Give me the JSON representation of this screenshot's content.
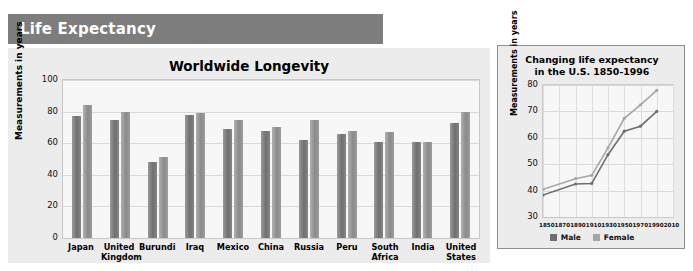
{
  "header": {
    "title": "Life Expectancy"
  },
  "colors": {
    "banner": "#7d7d7d",
    "panel": "#ececec",
    "plot": "#f7f7f7",
    "male": "#6f6f6f",
    "female": "#a6a6a6"
  },
  "main": {
    "title": "Worldwide Longevity",
    "ylabel": "Measurements in years",
    "legend": [
      {
        "label": "Male",
        "swatch": "male"
      },
      {
        "label": "Female",
        "swatch": "female"
      }
    ]
  },
  "inset": {
    "title_line1": "Changing life expectancy",
    "title_line2": "in the U.S. 1850-1996",
    "ylabel": "Measurements in years",
    "legend": [
      {
        "label": "Male",
        "swatch": "male"
      },
      {
        "label": "Female",
        "swatch": "female"
      }
    ]
  },
  "chart_data": [
    {
      "type": "bar",
      "title": "Worldwide Longevity",
      "xlabel": "",
      "ylabel": "Measurements in years",
      "ylim": [
        0,
        100
      ],
      "yticks": [
        0,
        20,
        40,
        60,
        80,
        100
      ],
      "grid": true,
      "legend_position": "bottom-left",
      "categories": [
        "Japan",
        "United Kingdom",
        "Burundi",
        "Iraq",
        "Mexico",
        "China",
        "Russia",
        "Peru",
        "South Africa",
        "India",
        "United States"
      ],
      "series": [
        {
          "name": "Male",
          "values": [
            77,
            75,
            48,
            78,
            69,
            68,
            62,
            66,
            61,
            61,
            73
          ]
        },
        {
          "name": "Female",
          "values": [
            84,
            80,
            51,
            79,
            75,
            70,
            75,
            68,
            67,
            61,
            80
          ]
        }
      ]
    },
    {
      "type": "line",
      "title": "Changing life expectancy in the U.S. 1850-1996",
      "xlabel": "",
      "ylabel": "Measurements in years",
      "ylim": [
        30,
        80
      ],
      "yticks": [
        30,
        40,
        50,
        60,
        70,
        80
      ],
      "xlim": [
        1850,
        2010
      ],
      "xticks": [
        1850,
        1870,
        1890,
        1910,
        1930,
        1950,
        1970,
        1990,
        2010
      ],
      "grid": true,
      "legend_position": "bottom-center",
      "x": [
        1850,
        1890,
        1910,
        1930,
        1950,
        1970,
        1990
      ],
      "series": [
        {
          "name": "Male",
          "values": [
            38.3,
            42.5,
            42.7,
            53.6,
            62.5,
            64.4,
            70.0
          ]
        },
        {
          "name": "Female",
          "values": [
            40.5,
            44.5,
            45.8,
            56.2,
            67.4,
            72.5,
            78.0
          ]
        }
      ]
    }
  ]
}
